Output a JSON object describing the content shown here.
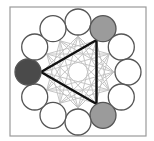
{
  "diagram": {
    "type": "circular-network",
    "frame": {
      "x": 10,
      "y": 7,
      "width": 136,
      "height": 129,
      "stroke": "#9a9a9a"
    },
    "center": {
      "x": 78,
      "y": 72
    },
    "ring_radius": 50,
    "inner_radius": 36,
    "node_radius": 13,
    "node_count": 12,
    "colors": {
      "node_fill": "#ffffff",
      "node_stroke": "#555555",
      "highlight_dark": "#4a4a4a",
      "highlight_gray": "#9b9b9b",
      "web_line": "#c4c4c4",
      "triangle": "#111111"
    },
    "nodes": [
      {
        "index": 0,
        "angle": -90,
        "state": "empty"
      },
      {
        "index": 1,
        "angle": -60,
        "state": "gray"
      },
      {
        "index": 2,
        "angle": -30,
        "state": "empty"
      },
      {
        "index": 3,
        "angle": 0,
        "state": "empty"
      },
      {
        "index": 4,
        "angle": 30,
        "state": "empty"
      },
      {
        "index": 5,
        "angle": 60,
        "state": "gray"
      },
      {
        "index": 6,
        "angle": 90,
        "state": "empty"
      },
      {
        "index": 7,
        "angle": 120,
        "state": "empty"
      },
      {
        "index": 8,
        "angle": 150,
        "state": "empty"
      },
      {
        "index": 9,
        "angle": 180,
        "state": "dark"
      },
      {
        "index": 10,
        "angle": 210,
        "state": "empty"
      },
      {
        "index": 11,
        "angle": 240,
        "state": "empty"
      }
    ],
    "triangle": [
      9,
      1,
      5
    ]
  }
}
